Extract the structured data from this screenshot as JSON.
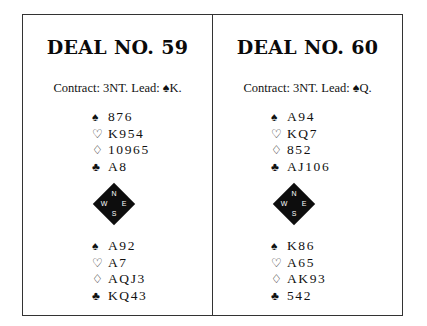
{
  "deals": [
    {
      "title": "DEAL NO. 59",
      "contract": "Contract: 3NT. Lead: ♠K.",
      "north": {
        "spades": "876",
        "hearts": "K954",
        "diamonds": "10965",
        "clubs": "A8"
      },
      "south": {
        "spades": "A92",
        "hearts": "A7",
        "diamonds": "AQJ3",
        "clubs": "KQ43"
      }
    },
    {
      "title": "DEAL NO. 60",
      "contract": "Contract: 3NT. Lead: ♠Q.",
      "north": {
        "spades": "A94",
        "hearts": "KQ7",
        "diamonds": "852",
        "clubs": "AJ106"
      },
      "south": {
        "spades": "K86",
        "hearts": "A65",
        "diamonds": "AK93",
        "clubs": "542"
      }
    }
  ],
  "suits": {
    "spades": "♠",
    "hearts": "♡",
    "diamonds": "♢",
    "clubs": "♣"
  },
  "compass": {
    "north": "N",
    "south": "S",
    "west": "W",
    "east": "E"
  }
}
